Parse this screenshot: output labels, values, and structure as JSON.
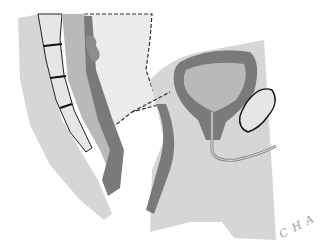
{
  "figure": {
    "kind": "anatomical illustration",
    "signature": "C H A"
  },
  "colors": {
    "background": "#ffffff",
    "tissue_light": "#d6d6d6",
    "tissue_mid": "#b9b9b9",
    "organ_dark": "#7a7a7a",
    "pale_region": "#ebebeb",
    "bone_fill": "#e6e6e6",
    "outline": "#222222"
  }
}
